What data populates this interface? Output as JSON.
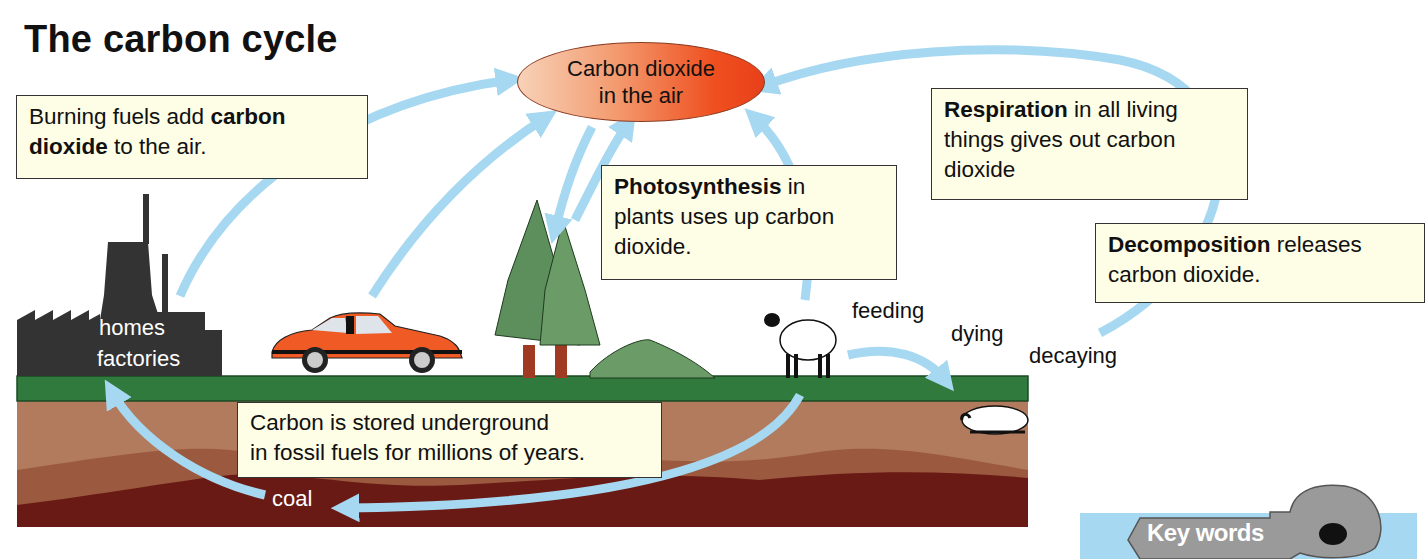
{
  "title": "The carbon cycle",
  "center_node": {
    "line1": "Carbon dioxide",
    "line2": "in the air"
  },
  "boxes": {
    "burning": {
      "bold": "carbon dioxide",
      "pre": "Burning fuels add ",
      "bold_a": "carbon",
      "bold_b": "dioxide",
      "post": " to the air."
    },
    "photosynthesis": {
      "bold": "Photosynthesis",
      "line1_rest": " in",
      "line2": "plants uses up carbon",
      "line3": "dioxide."
    },
    "respiration": {
      "bold": "Respiration",
      "line1_rest": " in all living",
      "line2": "things gives out carbon",
      "line3": "dioxide"
    },
    "decomposition": {
      "bold": "Decomposition",
      "line1_rest": " releases",
      "line2": "carbon dioxide."
    },
    "storage": {
      "line1": "Carbon is stored underground",
      "line2": "in fossil fuels for millions of years."
    }
  },
  "labels": {
    "homes": "homes",
    "factories": "factories",
    "feeding": "feeding",
    "dying": "dying",
    "decaying": "decaying",
    "coal": "coal"
  },
  "key_words": {
    "label": "Key words"
  },
  "colors": {
    "arrow": "#a7d8f1",
    "grass": "#2f7a3c",
    "soil_light": "#b27b5e",
    "soil_mid": "#8f4a34",
    "soil_dark": "#6a1a14",
    "box_fill": "#fefde6",
    "co2_hot": "#ef4f1f",
    "car": "#ef5a25",
    "factory": "#333333",
    "tree": "#5c8f5c"
  }
}
